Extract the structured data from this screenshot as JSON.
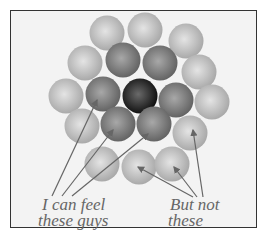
{
  "labels": {
    "left_line1": "I can feel",
    "left_line2": "these guys",
    "right_line1": "But not",
    "right_line2": "these"
  },
  "spheres": [
    {
      "x": 107,
      "y": 33,
      "shade": "light"
    },
    {
      "x": 145,
      "y": 30,
      "shade": "light"
    },
    {
      "x": 186,
      "y": 41,
      "shade": "light"
    },
    {
      "x": 85,
      "y": 63,
      "shade": "light"
    },
    {
      "x": 123,
      "y": 60,
      "shade": "mid"
    },
    {
      "x": 160,
      "y": 63,
      "shade": "mid"
    },
    {
      "x": 199,
      "y": 72,
      "shade": "light"
    },
    {
      "x": 66,
      "y": 96,
      "shade": "light"
    },
    {
      "x": 103,
      "y": 94,
      "shade": "mid"
    },
    {
      "x": 140,
      "y": 96,
      "shade": "dark"
    },
    {
      "x": 176,
      "y": 100,
      "shade": "mid"
    },
    {
      "x": 212,
      "y": 102,
      "shade": "light"
    },
    {
      "x": 82,
      "y": 126,
      "shade": "light"
    },
    {
      "x": 118,
      "y": 124,
      "shade": "mid"
    },
    {
      "x": 154,
      "y": 124,
      "shade": "mid"
    },
    {
      "x": 190,
      "y": 133,
      "shade": "light"
    },
    {
      "x": 102,
      "y": 164,
      "shade": "light"
    },
    {
      "x": 139,
      "y": 167,
      "shade": "light"
    },
    {
      "x": 172,
      "y": 164,
      "shade": "light"
    }
  ],
  "colors": {
    "light": "#b8b8b8",
    "mid": "#7d7d7d",
    "dark": "#1e1e1e",
    "arrow": "#666666",
    "frame": "#333333"
  }
}
